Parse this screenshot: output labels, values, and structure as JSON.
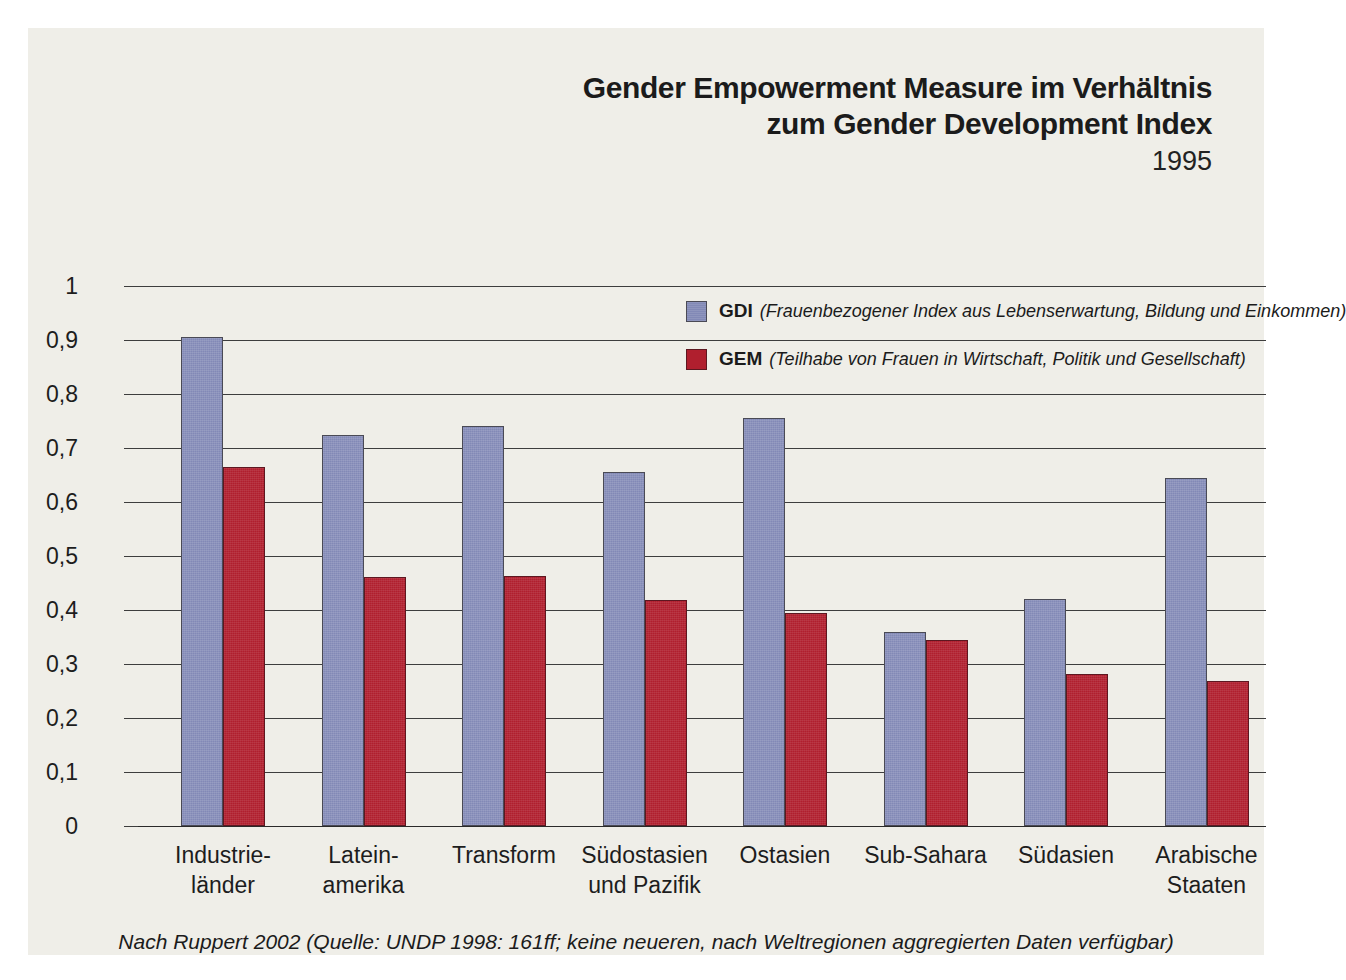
{
  "figure": {
    "title_line1": "Gender Empowerment Measure im Verhältnis",
    "title_line2": "zum Gender Development Index",
    "year": "1995",
    "caption": "Nach Ruppert 2002 (Quelle: UNDP 1998: 161ff; keine neueren, nach Weltregionen aggregierten Daten verfügbar)"
  },
  "legend": {
    "items": [
      {
        "key": "GDI",
        "description": "(Frauenbezogener Index aus Lebenserwartung, Bildung und Einkommen)",
        "color": "#8289b6"
      },
      {
        "key": "GEM",
        "description": "(Teilhabe von Frauen in Wirtschaft, Politik und Gesellschaft)",
        "color": "#b01f2e"
      }
    ]
  },
  "axis": {
    "y_ticks": [
      "1",
      "0,9",
      "0,8",
      "0,7",
      "0,6",
      "0,5",
      "0,4",
      "0,3",
      "0,2",
      "0,1",
      "0"
    ]
  },
  "categories": [
    {
      "line1": "Industrie-",
      "line2": "länder"
    },
    {
      "line1": "Latein-",
      "line2": "amerika"
    },
    {
      "line1": "Transform",
      "line2": ""
    },
    {
      "line1": "Südostasien",
      "line2": "und Pazifik"
    },
    {
      "line1": "Ostasien",
      "line2": ""
    },
    {
      "line1": "Sub-Sahara",
      "line2": ""
    },
    {
      "line1": "Südasien",
      "line2": ""
    },
    {
      "line1": "Arabische",
      "line2": "Staaten"
    }
  ],
  "chart_data": {
    "type": "bar",
    "title": "Gender Empowerment Measure im Verhältnis zum Gender Development Index",
    "subtitle": "1995",
    "xlabel": "",
    "ylabel": "",
    "ylim": [
      0,
      1
    ],
    "ytick_values": [
      0,
      0.1,
      0.2,
      0.3,
      0.4,
      0.5,
      0.6,
      0.7,
      0.8,
      0.9,
      1
    ],
    "grid": true,
    "legend_position": "inside-top-right",
    "categories": [
      "Industrieländer",
      "Lateinamerika",
      "Transform",
      "Südostasien und Pazifik",
      "Ostasien",
      "Sub-Sahara",
      "Südasien",
      "Arabische Staaten"
    ],
    "series": [
      {
        "name": "GDI",
        "label": "GDI (Frauenbezogener Index aus Lebenserwartung, Bildung und Einkommen)",
        "color": "#8289b6",
        "values": [
          0.905,
          0.725,
          0.74,
          0.655,
          0.755,
          0.36,
          0.42,
          0.645
        ]
      },
      {
        "name": "GEM",
        "label": "GEM (Teilhabe von Frauen in Wirtschaft, Politik und Gesellschaft)",
        "color": "#b01f2e",
        "values": [
          0.665,
          0.462,
          0.463,
          0.418,
          0.395,
          0.345,
          0.282,
          0.268
        ]
      }
    ],
    "source": "Nach Ruppert 2002 (Quelle: UNDP 1998: 161ff; keine neueren, nach Weltregionen aggregierten Daten verfügbar)"
  }
}
